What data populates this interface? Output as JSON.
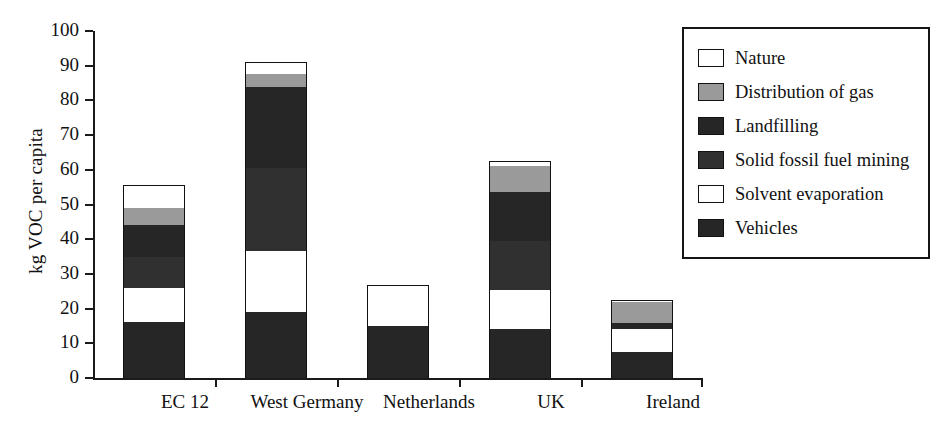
{
  "chart_data": {
    "type": "bar",
    "subtype": "stacked-bar",
    "title": "",
    "xlabel": "",
    "ylabel": "kg VOC per capita",
    "ylim": [
      0,
      100
    ],
    "yticks": [
      0,
      10,
      20,
      30,
      40,
      50,
      60,
      70,
      80,
      90,
      100
    ],
    "ytick_labels": [
      "0",
      "10",
      "20",
      "30",
      "40",
      "50",
      "60",
      "70",
      "80",
      "90",
      "100"
    ],
    "grid": false,
    "legend_position": "right",
    "categories": [
      "EC 12",
      "West Germany",
      "Netherlands",
      "UK",
      "Ireland"
    ],
    "series": [
      {
        "name": "Vehicles",
        "color": "#262626",
        "values": [
          16.0,
          19.0,
          15.0,
          14.0,
          7.5
        ]
      },
      {
        "name": "Solvent evaporation",
        "color": "#ffffff",
        "values": [
          10.0,
          17.5,
          11.0,
          11.5,
          6.5
        ]
      },
      {
        "name": "Solid fossil fuel mining",
        "color": "#303030",
        "values": [
          9.0,
          24.0,
          0.0,
          14.0,
          0.0
        ]
      },
      {
        "name": "Landfilling",
        "color": "#262626",
        "values": [
          9.0,
          23.5,
          0.0,
          14.0,
          2.0
        ]
      },
      {
        "name": "Distribution of gas",
        "color": "#9a9a9a",
        "values": [
          5.0,
          3.5,
          0.0,
          7.5,
          6.0
        ]
      },
      {
        "name": "Nature",
        "color": "#ffffff",
        "values": [
          6.5,
          3.5,
          0.7,
          1.5,
          0.5
        ]
      }
    ],
    "totals": [
      55.5,
      91.0,
      26.7,
      62.5,
      22.5
    ]
  },
  "legend": {
    "entries": [
      {
        "label": "Nature",
        "swatch": "#ffffff"
      },
      {
        "label": "Distribution of gas",
        "swatch": "#9a9a9a"
      },
      {
        "label": "Landfilling",
        "swatch": "#262626"
      },
      {
        "label": "Solid fossil fuel mining",
        "swatch": "#303030"
      },
      {
        "label": "Solvent evaporation",
        "swatch": "#ffffff"
      },
      {
        "label": "Vehicles",
        "swatch": "#262626"
      }
    ]
  },
  "axis": {
    "y_title": "kg VOC per capita"
  },
  "colors": {
    "axis": "#1a1a1a",
    "outline": "#111111",
    "background": "#ffffff"
  }
}
